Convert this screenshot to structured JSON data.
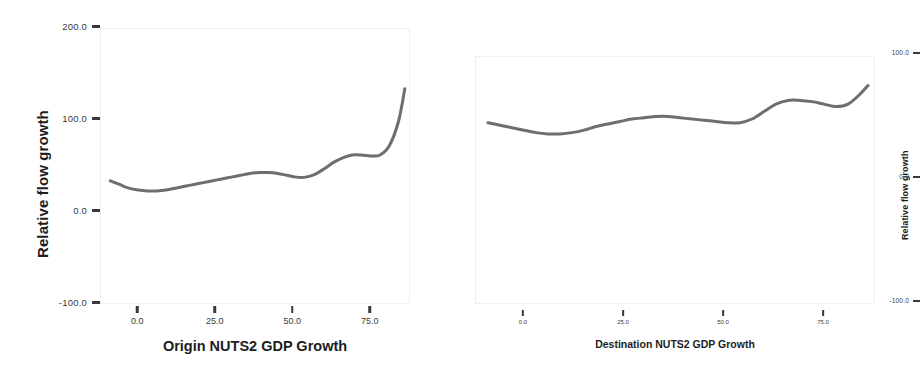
{
  "figure": {
    "background": "#ffffff",
    "line_color": "#6e6e6e"
  },
  "chart_data": [
    {
      "type": "line",
      "panel": "left",
      "title": "",
      "xlabel": "Origin NUTS2 GDP Growth",
      "ylabel": "Relative flow growth",
      "xlim": [
        -12,
        88
      ],
      "ylim": [
        -100.0,
        200.0
      ],
      "grid": false,
      "legend": null,
      "xticks": [
        0.0,
        25.0,
        50.0,
        75.0
      ],
      "xtick_labels": [
        "0.0",
        "25.0",
        "50.0",
        "75.0"
      ],
      "yticks": [
        200.0,
        100.0,
        0.0,
        -100.0
      ],
      "ytick_labels": [
        "200.0",
        "100.0",
        "0.0",
        "-100.0"
      ],
      "series": [
        {
          "name": "Relative flow growth (origin)",
          "x": [
            -9,
            -6,
            -3,
            0,
            3,
            6,
            9,
            12,
            15,
            18,
            21,
            24,
            27,
            30,
            33,
            36,
            39,
            42,
            45,
            48,
            51,
            54,
            57,
            60,
            63,
            66,
            69,
            72,
            75,
            78,
            81,
            84,
            86
          ],
          "y": [
            35,
            31,
            27,
            25,
            24,
            24,
            25,
            27,
            29,
            31,
            33,
            35,
            37,
            39,
            41,
            43,
            44,
            44,
            43,
            41,
            39,
            39,
            42,
            48,
            55,
            60,
            63,
            63,
            62,
            63,
            73,
            100,
            135
          ]
        }
      ]
    },
    {
      "type": "line",
      "panel": "right",
      "title": "",
      "xlabel": "Destination NUTS2 GDP Growth",
      "ylabel": "Relative flow growth",
      "xlim": [
        -12,
        88
      ],
      "ylim": [
        -100.0,
        100.0
      ],
      "grid": false,
      "legend": null,
      "xticks": [
        0.0,
        25.0,
        50.0,
        75.0
      ],
      "xtick_labels": [
        "0.0",
        "25.0",
        "50.0",
        "75.0"
      ],
      "yticks": [
        100.0,
        0.0,
        -100.0
      ],
      "ytick_labels": [
        "100.0",
        "0.0",
        "-100.0"
      ],
      "series": [
        {
          "name": "Relative flow growth (destination)",
          "x": [
            -9,
            -6,
            -3,
            0,
            3,
            6,
            9,
            12,
            15,
            18,
            21,
            24,
            27,
            30,
            33,
            36,
            39,
            42,
            45,
            48,
            51,
            54,
            57,
            60,
            63,
            66,
            69,
            72,
            75,
            78,
            81,
            84,
            86
          ],
          "y": [
            47,
            45,
            43,
            41,
            39,
            38,
            38,
            39,
            41,
            44,
            46,
            48,
            50,
            51,
            52,
            52,
            51,
            50,
            49,
            48,
            47,
            47,
            50,
            56,
            62,
            65,
            65,
            64,
            62,
            60,
            62,
            70,
            77
          ]
        }
      ]
    }
  ],
  "panels": {
    "left": {
      "y_axis_title": "Relative flow growth",
      "x_axis_title": "Origin NUTS2 GDP Growth",
      "y_ticks": [
        {
          "label": "200.0",
          "value": 200.0
        },
        {
          "label": "100.0",
          "value": 100.0
        },
        {
          "label": "0.0",
          "value": 0.0
        },
        {
          "label": "-100.0",
          "value": -100.0
        }
      ],
      "x_ticks": [
        {
          "label": "0.0",
          "value": 0.0
        },
        {
          "label": "25.0",
          "value": 25.0
        },
        {
          "label": "50.0",
          "value": 50.0
        },
        {
          "label": "75.0",
          "value": 75.0
        }
      ]
    },
    "right": {
      "y_axis_title": "Relative flow growth",
      "x_axis_title": "Destination NUTS2 GDP Growth",
      "y_ticks": [
        {
          "label": "100.0",
          "value": 100.0
        },
        {
          "label": "0.0",
          "value": 0.0
        },
        {
          "label": "-100.0",
          "value": -100.0
        }
      ],
      "x_ticks": [
        {
          "label": "0.0",
          "value": 0.0
        },
        {
          "label": "25.0",
          "value": 25.0
        },
        {
          "label": "50.0",
          "value": 50.0
        },
        {
          "label": "75.0",
          "value": 75.0
        }
      ]
    }
  }
}
